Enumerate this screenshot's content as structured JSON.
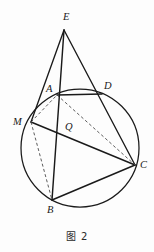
{
  "figure": {
    "caption": "图 2",
    "caption_number": "2",
    "type": "plane-geometry-diagram",
    "stroke_color": "#1a1a1a",
    "background_color": "#fdfdfd"
  },
  "labels": {
    "E": "E",
    "A": "A",
    "D": "D",
    "M": "M",
    "Q": "Q",
    "C": "C",
    "B": "B"
  },
  "points": [
    {
      "name": "E",
      "label": "E",
      "x": 64,
      "y": 30,
      "label_x": 63,
      "label_y": 12,
      "on_circle": false
    },
    {
      "name": "A",
      "label": "A",
      "x": 57,
      "y": 95,
      "label_x": 46,
      "label_y": 84,
      "on_circle": true
    },
    {
      "name": "D",
      "label": "D",
      "x": 102,
      "y": 94,
      "label_x": 104,
      "label_y": 81,
      "on_circle": true
    },
    {
      "name": "M",
      "label": "M",
      "x": 31,
      "y": 122,
      "label_x": 13,
      "label_y": 117,
      "on_circle": true
    },
    {
      "name": "Q",
      "label": "Q",
      "x": 62,
      "y": 128,
      "label_x": 65,
      "label_y": 122,
      "on_circle": false
    },
    {
      "name": "C",
      "label": "C",
      "x": 135,
      "y": 165,
      "label_x": 140,
      "label_y": 160,
      "on_circle": true
    },
    {
      "name": "B",
      "label": "B",
      "x": 52,
      "y": 200,
      "label_x": 47,
      "label_y": 205,
      "on_circle": true
    }
  ],
  "circle": {
    "center_x": 80,
    "center_y": 148,
    "radius": 59
  },
  "segments": [
    {
      "name": "EM",
      "from": "E",
      "to": "M",
      "style": "solid"
    },
    {
      "name": "EB",
      "from": "E",
      "to": "B",
      "style": "solid"
    },
    {
      "name": "EC",
      "from": "E",
      "to": "C",
      "style": "solid"
    },
    {
      "name": "AD",
      "from": "A",
      "to": "D",
      "style": "solid"
    },
    {
      "name": "MC",
      "from": "M",
      "to": "C",
      "style": "solid"
    },
    {
      "name": "BC",
      "from": "B",
      "to": "C",
      "style": "solid"
    },
    {
      "name": "MA",
      "from": "M",
      "to": "A",
      "style": "dashed"
    },
    {
      "name": "AC",
      "from": "A",
      "to": "C",
      "style": "dashed"
    },
    {
      "name": "MB",
      "from": "M",
      "to": "B",
      "style": "dashed"
    }
  ]
}
